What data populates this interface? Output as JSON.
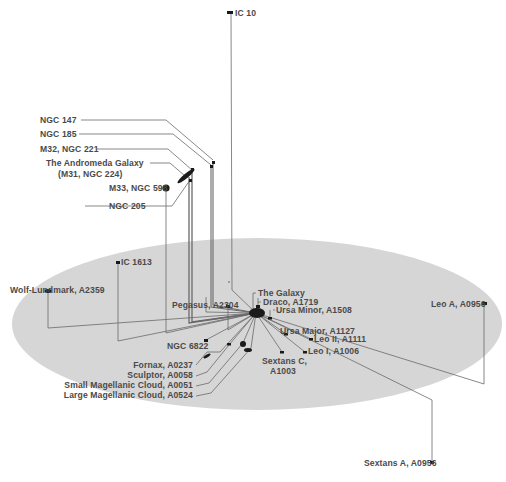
{
  "diagram": {
    "type": "3d-perspective-map",
    "colors": {
      "background": "#ffffff",
      "plane": "#d6d6d6",
      "line": "#6a6a6a",
      "galaxy": "#1a1a1a",
      "label": "#4a4a4a"
    },
    "plane": {
      "cx": 257,
      "cy": 324,
      "rx": 245,
      "ry": 86
    },
    "center": {
      "x": 256,
      "y": 313
    },
    "labels": {
      "ic10": "IC 10",
      "ngc147": "NGC 147",
      "ngc185": "NGC 185",
      "m32": "M32, NGC 221",
      "andromeda_1": "The Andromeda Galaxy",
      "andromeda_2": "(M31, NGC 224)",
      "m33": "M33, NGC 598",
      "ngc205": "NGC 205",
      "ic1613": "IC 1613",
      "wolf": "Wolf-Lundmark, A2359",
      "pegasus": "Pegasus, A2304",
      "galaxy": "The Galaxy",
      "draco": "Draco, A1719",
      "ursa_minor": "Ursa Minor, A1508",
      "ursa_major": "Ursa Major, A1127",
      "leo2": "Leo II, A1111",
      "leo1": "Leo I, A1006",
      "sextans_c_1": "Sextans C,",
      "sextans_c_2": "A1003",
      "ngc6822": "NGC 6822",
      "fornax": "Fornax, A0237",
      "sculptor": "Sculptor, A0058",
      "smc": "Small Magellanic Cloud, A0051",
      "lmc": "Large Magellanic Cloud, A0524",
      "leo_a": "Leo A, A0956",
      "sextans_a": "Sextans A, A0956"
    }
  }
}
